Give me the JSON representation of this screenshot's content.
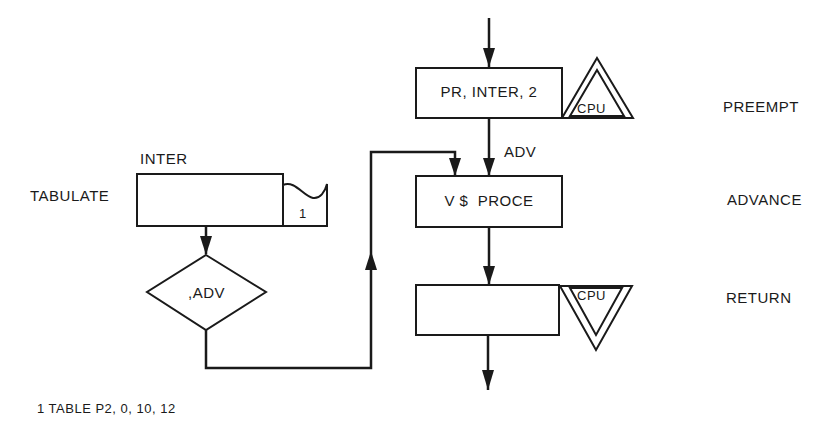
{
  "diagram": {
    "type": "GPSS block diagram",
    "blocks": [
      {
        "id": "preempt",
        "operand": "PR, INTER, 2",
        "block_name": "PREEMPT",
        "facility_label": "CPU"
      },
      {
        "id": "advance",
        "operand": "V $  PROCE",
        "block_name": "ADVANCE",
        "entry_label": "ADV"
      },
      {
        "id": "return",
        "operand": "",
        "block_name": "RETURN",
        "facility_label": "CPU"
      },
      {
        "id": "tabulate",
        "operand": "INTER",
        "block_name": "TABULATE",
        "table_ref": "1"
      },
      {
        "id": "transfer",
        "operand": ",ADV"
      }
    ],
    "footnote": "1 TABLE P2, 0, 10, 12"
  },
  "colors": {
    "line": "#1a1a1a",
    "background": "#ffffff"
  }
}
